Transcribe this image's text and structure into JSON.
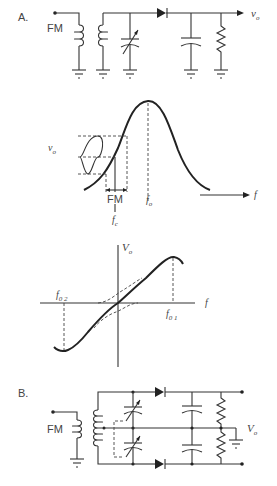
{
  "circuit_a": {
    "label": "A.",
    "input_label": "FM",
    "output_label": "v",
    "output_sub": "o",
    "components": [
      "input-terminal",
      "primary-coil",
      "secondary-coil",
      "variable-capacitor",
      "diode",
      "filter-capacitor",
      "load-resistor",
      "ground x5"
    ]
  },
  "response_curve": {
    "vo_label": "v",
    "vo_sub": "o",
    "fm_label": "FM",
    "fc_label": "f",
    "fc_sub": "c",
    "fo_label": "f",
    "fo_sub": "o",
    "axis_label": "f"
  },
  "s_curve": {
    "y_axis_label": "V",
    "y_axis_sub": "o",
    "x_axis_label": "f",
    "f02_label": "f",
    "f02_sub": "0 2",
    "f01_label": "f",
    "f01_sub": "0 1"
  },
  "circuit_b": {
    "label": "B.",
    "input_label": "FM",
    "output_label": "V",
    "output_sub": "o",
    "components": [
      "input-terminal",
      "primary-coil",
      "center-tapped-secondary",
      "ganged-variable-capacitors x2",
      "diodes x2",
      "filter-capacitors x2",
      "load-resistors x2",
      "ground x2",
      "output-terminals x2"
    ]
  }
}
